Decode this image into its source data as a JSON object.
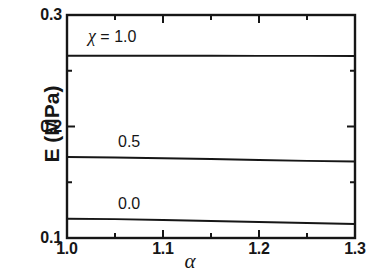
{
  "chart_data": {
    "type": "line",
    "title": "",
    "xlabel": "α",
    "ylabel": "E (MPa)",
    "xlim": [
      1.0,
      1.3
    ],
    "ylim": [
      0.1,
      0.3
    ],
    "xticks": [
      "1.0",
      "1.1",
      "1.2",
      "1.3"
    ],
    "xtick_values": [
      1.0,
      1.1,
      1.2,
      1.3
    ],
    "x_minor_ticks": [
      1.05,
      1.15,
      1.25
    ],
    "yticks": [
      "0.1",
      "0.2",
      "0.3"
    ],
    "ytick_values": [
      0.1,
      0.2,
      0.3
    ],
    "grid": false,
    "legend": "inline-annotations",
    "series": [
      {
        "name": "χ = 1.0",
        "annotation": "χ = 1.0",
        "chi": 1.0,
        "color": "#161616",
        "x": [
          1.0,
          1.05,
          1.1,
          1.15,
          1.2,
          1.25,
          1.3
        ],
        "values": [
          0.2635,
          0.2635,
          0.2634,
          0.2634,
          0.2633,
          0.2633,
          0.2632
        ]
      },
      {
        "name": "0.5",
        "annotation": "0.5",
        "chi": 0.5,
        "color": "#161616",
        "x": [
          1.0,
          1.05,
          1.1,
          1.15,
          1.2,
          1.25,
          1.3
        ],
        "values": [
          0.1727,
          0.1722,
          0.1715,
          0.1708,
          0.17,
          0.1692,
          0.1686
        ]
      },
      {
        "name": "0.0",
        "annotation": "0.0",
        "chi": 0.0,
        "color": "#161616",
        "x": [
          1.0,
          1.05,
          1.1,
          1.15,
          1.2,
          1.25,
          1.3
        ],
        "values": [
          0.1173,
          0.1169,
          0.1162,
          0.1153,
          0.1144,
          0.1134,
          0.1126
        ]
      }
    ],
    "annotations": [
      {
        "text": "χ = 1.0",
        "x": 1.055,
        "y": 0.2855
      },
      {
        "text": "0.5",
        "x": 1.078,
        "y": 0.1895
      },
      {
        "text": "0.0",
        "x": 1.078,
        "y": 0.133
      }
    ]
  },
  "axes": {
    "x_tick_labels": [
      "1.0",
      "1.1",
      "1.2",
      "1.3"
    ],
    "y_tick_labels": [
      "0.3",
      "0.2",
      "0.1"
    ],
    "x_axis_title": "α",
    "y_axis_title": "E (MPa)"
  },
  "annotation_labels": {
    "chi_symbol": "χ",
    "chi_top": " = 1.0",
    "mid": "0.5",
    "bottom": "0.0"
  },
  "style": {
    "axis_color": "#161616",
    "curve_color": "#161616",
    "background": "#ffffff"
  }
}
